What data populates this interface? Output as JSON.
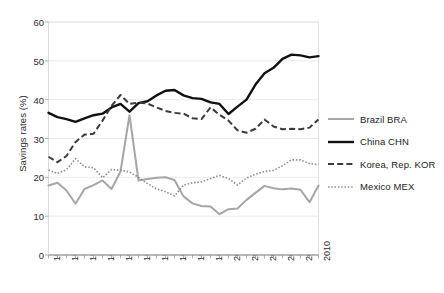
{
  "chart_data": {
    "type": "line",
    "title": "",
    "xlabel": "",
    "ylabel": "Savings rates (%)",
    "ylim": [
      0,
      60
    ],
    "ytick_values": [
      0,
      10,
      20,
      30,
      40,
      50,
      60
    ],
    "xlim": [
      1980,
      2010
    ],
    "x": [
      1980,
      1981,
      1982,
      1983,
      1984,
      1985,
      1986,
      1987,
      1988,
      1989,
      1990,
      1991,
      1992,
      1993,
      1994,
      1995,
      1996,
      1997,
      1998,
      1999,
      2000,
      2001,
      2002,
      2003,
      2004,
      2005,
      2006,
      2007,
      2008,
      2009,
      2010
    ],
    "xtick_labels": [
      "1980",
      "1982",
      "1984",
      "1986",
      "1988",
      "1990",
      "1992",
      "1994",
      "1996",
      "1998",
      "2000",
      "2002",
      "2004",
      "2006",
      "2008",
      "2010"
    ],
    "xtick_values": [
      1980,
      1982,
      1984,
      1986,
      1988,
      1990,
      1992,
      1994,
      1996,
      1998,
      2000,
      2002,
      2004,
      2006,
      2008,
      2010
    ],
    "grid": "horizontal",
    "legend_position": "right",
    "series": [
      {
        "name": "Brazil BRA",
        "key": "brazil",
        "style": "solid",
        "color": "#a6a6a6",
        "width": 2.0,
        "values": [
          17.9,
          18.6,
          16.6,
          13.2,
          17.0,
          18.0,
          19.2,
          17.0,
          21.5,
          36.0,
          19.2,
          19.6,
          19.9,
          20.0,
          19.3,
          15.1,
          13.3,
          12.6,
          12.5,
          10.5,
          11.8,
          12.0,
          14.2,
          16.0,
          17.8,
          17.2,
          16.9,
          17.1,
          16.8,
          13.6,
          17.9
        ],
        "marker": "none"
      },
      {
        "name": "China CHN",
        "key": "china",
        "style": "solid",
        "color": "#111111",
        "width": 2.4,
        "values": [
          36.6,
          35.5,
          35.0,
          34.3,
          35.2,
          36.0,
          36.4,
          38.0,
          38.9,
          36.9,
          39.1,
          39.6,
          41.1,
          42.3,
          42.5,
          41.1,
          40.4,
          40.2,
          39.3,
          38.9,
          36.3,
          38.2,
          40.0,
          43.9,
          46.8,
          48.2,
          50.5,
          51.6,
          51.4,
          50.9,
          51.2
        ],
        "marker": "none"
      },
      {
        "name": "Korea, Rep. KOR",
        "key": "korea",
        "style": "dashed",
        "color": "#3a3a3a",
        "width": 2.0,
        "values": [
          25.3,
          23.9,
          25.5,
          29.1,
          31.0,
          31.2,
          34.6,
          38.4,
          41.2,
          38.9,
          39.2,
          39.0,
          38.0,
          37.1,
          36.6,
          36.4,
          35.2,
          35.0,
          38.0,
          36.1,
          34.6,
          32.1,
          31.5,
          32.5,
          34.9,
          33.1,
          32.4,
          32.5,
          32.4,
          32.8,
          34.9
        ],
        "marker": "none"
      },
      {
        "name": "Mexico MEX",
        "key": "mexico",
        "style": "dotted",
        "color": "#8c8c8c",
        "width": 1.6,
        "values": [
          21.9,
          21.0,
          22.0,
          24.8,
          22.7,
          22.5,
          19.9,
          22.0,
          21.8,
          21.4,
          20.0,
          18.4,
          17.0,
          16.3,
          15.2,
          18.0,
          18.6,
          18.8,
          19.7,
          20.5,
          19.7,
          18.0,
          19.8,
          20.8,
          21.5,
          21.8,
          23.0,
          24.5,
          24.5,
          23.5,
          23.3
        ],
        "marker": "none"
      }
    ]
  },
  "legend": {
    "entries": [
      {
        "label": "Brazil BRA"
      },
      {
        "label": "China CHN"
      },
      {
        "label": "Korea, Rep. KOR"
      },
      {
        "label": "Mexico MEX"
      }
    ]
  }
}
